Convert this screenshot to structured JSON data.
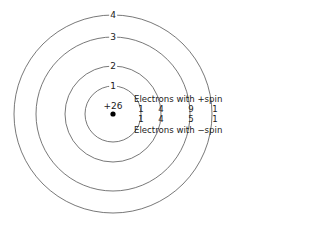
{
  "diagram": {
    "nucleus": {
      "charge_label": "+26"
    },
    "shells": [
      {
        "label": "1",
        "radius": 28
      },
      {
        "label": "2",
        "radius": 48
      },
      {
        "label": "3",
        "radius": 77
      },
      {
        "label": "4",
        "radius": 99
      }
    ],
    "legend": {
      "plus_spin": "Electrons with +spin",
      "minus_spin": "Electrons with −spin"
    },
    "electrons_plus_spin": [
      "1",
      "4",
      "9",
      "1"
    ],
    "electrons_minus_spin": [
      "1",
      "4",
      "5",
      "1"
    ],
    "colors": {
      "line": "#555555",
      "nucleus": "#000000",
      "text": "#222222"
    }
  }
}
